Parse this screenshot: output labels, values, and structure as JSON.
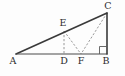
{
  "figure": {
    "background_color": "#fdfdfd",
    "stroke_color": "#3a3a3a",
    "dashed_color": "#8d8d8d",
    "labels": {
      "a": "A",
      "b": "B",
      "c": "C",
      "d": "D",
      "e": "E",
      "f": "F"
    },
    "points": {
      "A": {
        "x": 16,
        "y": 54
      },
      "B": {
        "x": 107,
        "y": 54
      },
      "C": {
        "x": 107,
        "y": 13
      },
      "D": {
        "x": 64,
        "y": 54
      },
      "E": {
        "x": 64,
        "y": 31
      },
      "F": {
        "x": 81,
        "y": 54
      }
    },
    "label_positions": {
      "A": {
        "x": 13,
        "y": 64
      },
      "B": {
        "x": 106,
        "y": 64
      },
      "C": {
        "x": 108,
        "y": 9
      },
      "D": {
        "x": 64,
        "y": 64
      },
      "E": {
        "x": 63,
        "y": 26
      },
      "F": {
        "x": 81,
        "y": 64
      }
    },
    "solid_edges": [
      {
        "name": "hypotenuse-AC",
        "from": "A",
        "to": "C"
      },
      {
        "name": "base-AB",
        "from": "A",
        "to": "B"
      },
      {
        "name": "side-CB",
        "from": "C",
        "to": "B"
      }
    ],
    "dashed_edges": [
      {
        "name": "segment-ED",
        "from": "E",
        "to": "D"
      },
      {
        "name": "segment-EF",
        "from": "E",
        "to": "F"
      },
      {
        "name": "segment-CF",
        "from": "C",
        "to": "F"
      }
    ],
    "right_angle": {
      "at": "B",
      "size": 7.5
    }
  }
}
